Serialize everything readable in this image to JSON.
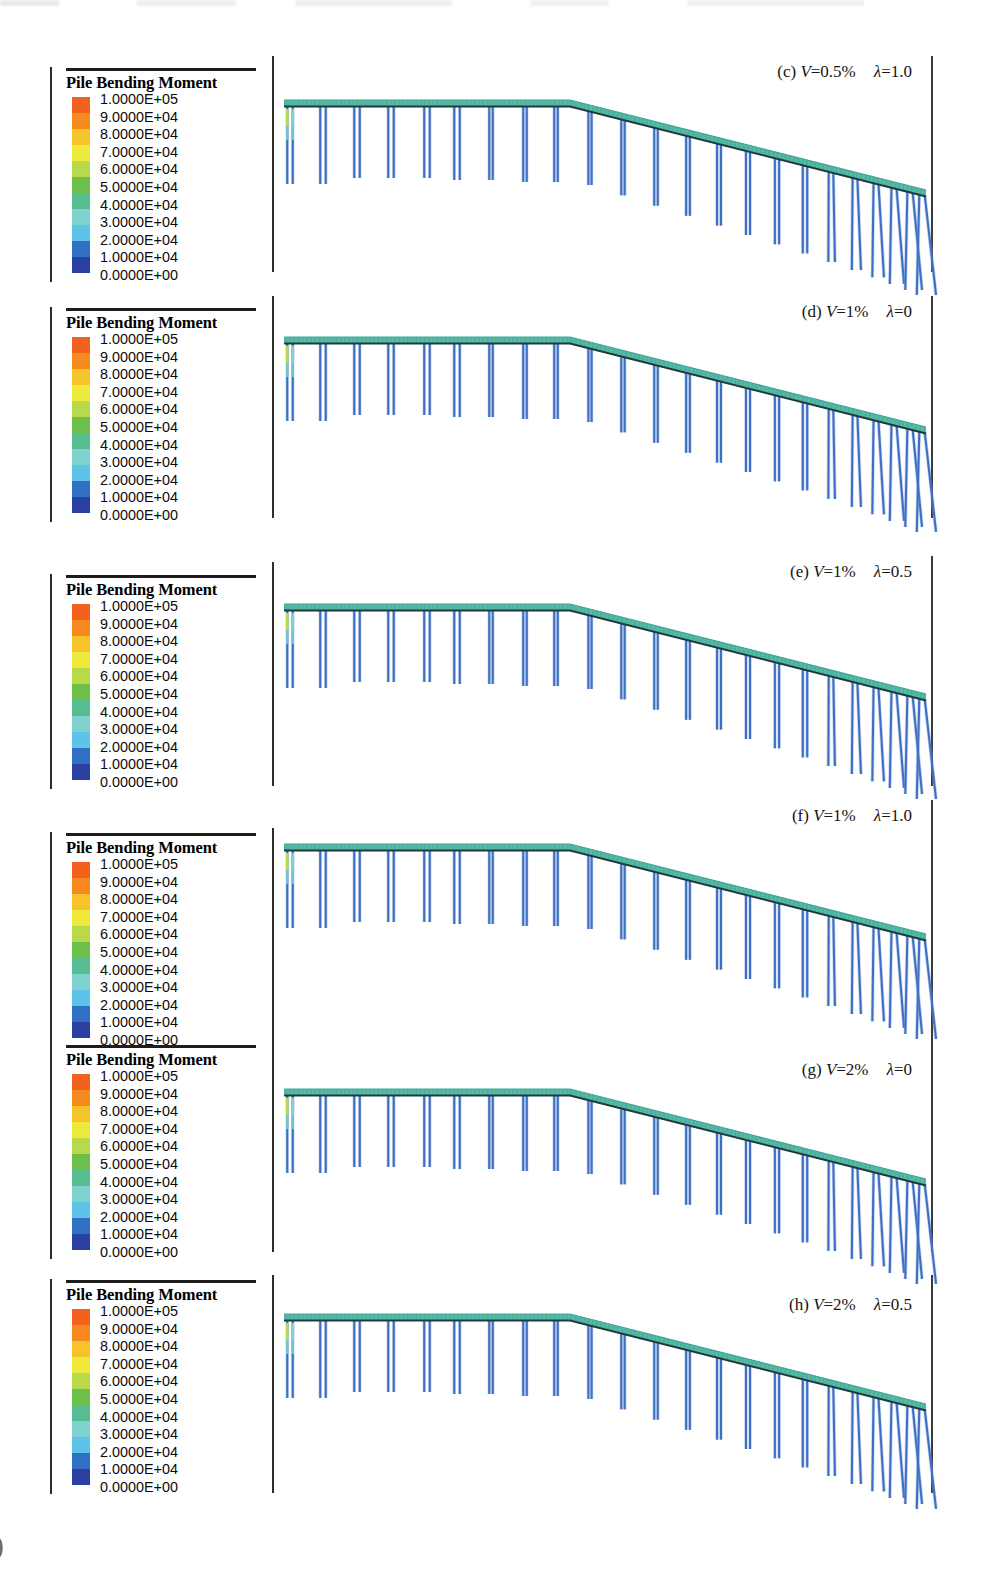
{
  "figure": {
    "type": "fem-contour-panels",
    "page_artifact_bottom_left": ")",
    "legend_title": "Pile Bending Moment",
    "legend_ticks": [
      "1.0000E+05",
      "9.0000E+04",
      "8.0000E+04",
      "7.0000E+04",
      "6.0000E+04",
      "5.0000E+04",
      "4.0000E+04",
      "3.0000E+04",
      "2.0000E+04",
      "1.0000E+04",
      "0.0000E+00"
    ],
    "legend_colors": [
      "#f4601e",
      "#f68a1f",
      "#f5c32a",
      "#efe93c",
      "#b7d94a",
      "#6cc04a",
      "#54bd91",
      "#7fd2cf",
      "#5ec3e8",
      "#2f6fc4",
      "#2b3fa0"
    ],
    "deck_color": "#56b9a6",
    "deck_edge_color": "#1e3a3a",
    "pile_color": "#3d6fc4",
    "pile_hotspot_colors": [
      "#b7d94a",
      "#6cc04a",
      "#7fd2cf"
    ],
    "panels": [
      {
        "id": "c",
        "label_index": "(c)",
        "param_v_symbol": "V",
        "param_v_value": "=0.5%",
        "param_lambda_symbol": "λ",
        "param_lambda_value": "=1.0",
        "caption_text": "(c) V=0.5%   λ=1.0"
      },
      {
        "id": "d",
        "label_index": "(d)",
        "param_v_symbol": "V",
        "param_v_value": "=1%",
        "param_lambda_symbol": "λ",
        "param_lambda_value": "=0",
        "caption_text": "(d) V=1%   λ=0"
      },
      {
        "id": "e",
        "label_index": "(e)",
        "param_v_symbol": "V",
        "param_v_value": "=1%",
        "param_lambda_symbol": "λ",
        "param_lambda_value": "=0.5",
        "caption_text": "(e) V=1%   λ=0.5"
      },
      {
        "id": "f",
        "label_index": "(f)",
        "param_v_symbol": "V",
        "param_v_value": "=1%",
        "param_lambda_symbol": "λ",
        "param_lambda_value": "=1.0",
        "caption_text": "(f) V=1%   λ=1.0"
      },
      {
        "id": "g",
        "label_index": "(g)",
        "param_v_symbol": "V",
        "param_v_value": "=2%",
        "param_lambda_symbol": "λ",
        "param_lambda_value": "=0",
        "caption_text": "(g) V=2%   λ=0"
      },
      {
        "id": "h",
        "label_index": "(h)",
        "param_v_symbol": "V",
        "param_v_value": "=2%",
        "param_lambda_symbol": "λ",
        "param_lambda_value": "=0.5",
        "caption_text": "(h) V=2%   λ=0.5"
      }
    ]
  },
  "chart_data": {
    "type": "heatmap",
    "title": "Pile Bending Moment",
    "subtitle": "Contour plots of pile bending moment for a pile-supported bridge model",
    "colorbar": {
      "label": "Pile Bending Moment",
      "ticks": [
        100000,
        90000,
        80000,
        70000,
        60000,
        50000,
        40000,
        30000,
        20000,
        10000,
        0
      ],
      "tick_labels": [
        "1.0000E+05",
        "9.0000E+04",
        "8.0000E+04",
        "7.0000E+04",
        "6.0000E+04",
        "5.0000E+04",
        "4.0000E+04",
        "3.0000E+04",
        "2.0000E+04",
        "1.0000E+04",
        "0.0000E+00"
      ],
      "colors": [
        "#f4601e",
        "#f68a1f",
        "#f5c32a",
        "#efe93c",
        "#b7d94a",
        "#6cc04a",
        "#54bd91",
        "#7fd2cf",
        "#5ec3e8",
        "#2f6fc4",
        "#2b3fa0"
      ],
      "range": [
        0,
        100000
      ],
      "position": "left"
    },
    "grid": false,
    "legend_position": "left",
    "panels": [
      {
        "id": "c",
        "label": "(c) V=0.5%   λ=1.0",
        "V": "0.5%",
        "lambda": "1.0",
        "max_moment_observed": 60000
      },
      {
        "id": "d",
        "label": "(d) V=1%   λ=0",
        "V": "1%",
        "lambda": "0",
        "max_moment_observed": 60000
      },
      {
        "id": "e",
        "label": "(e) V=1%   λ=0.5",
        "V": "1%",
        "lambda": "0.5",
        "max_moment_observed": 65000
      },
      {
        "id": "f",
        "label": "(f) V=1%   λ=1.0",
        "V": "1%",
        "lambda": "1.0",
        "max_moment_observed": 65000
      },
      {
        "id": "g",
        "label": "(g) V=2%   λ=0",
        "V": "2%",
        "lambda": "0",
        "max_moment_observed": 70000
      },
      {
        "id": "h",
        "label": "(h) V=2%   λ=0.5",
        "V": "2%",
        "lambda": "0.5",
        "max_moment_observed": 70000
      }
    ]
  }
}
